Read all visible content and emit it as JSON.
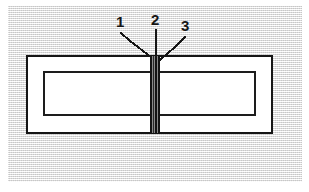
{
  "figure": {
    "type": "technical-line-drawing",
    "background_color": "#e9e9e9",
    "line_color": "#151515",
    "fill_color": "#ffffff"
  },
  "outer_plate": {
    "name": "outer-rectangle",
    "x": 27,
    "y": 56,
    "width": 245,
    "height": 77,
    "stroke_width": 2
  },
  "inner_plate": {
    "name": "inner-rectangle",
    "x": 44,
    "y": 72,
    "width": 211,
    "height": 43,
    "stroke_width": 2
  },
  "weld_seam": {
    "name": "center-weld-seam",
    "x": 150,
    "y": 56,
    "width": 10,
    "height": 77,
    "band_color": "#1a1a1a",
    "description": "dark hatched vertical seam spanning full plate thickness"
  },
  "callouts": [
    {
      "id": "1",
      "label": "1",
      "label_x": 116,
      "label_y": 14,
      "leader": {
        "type": "polyline",
        "points": "121,33 130,41 151,57"
      }
    },
    {
      "id": "2",
      "label": "2",
      "label_x": 151,
      "label_y": 12,
      "leader": {
        "type": "line",
        "points": "156,30 156,57"
      }
    },
    {
      "id": "3",
      "label": "3",
      "label_x": 181,
      "label_y": 18,
      "leader": {
        "type": "polyline",
        "points": "185,37 175,47 160,60"
      }
    }
  ]
}
